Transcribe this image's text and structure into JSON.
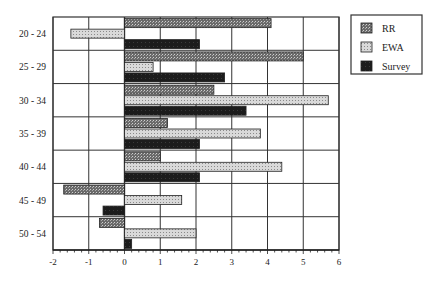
{
  "chart_data": {
    "type": "bar",
    "orientation": "horizontal",
    "title": "",
    "xlabel": "",
    "ylabel": "",
    "categories": [
      "20 - 24",
      "25 - 29",
      "30 - 34",
      "35 - 39",
      "40 - 44",
      "45 - 49",
      "50 - 54"
    ],
    "series": [
      {
        "name": "RR",
        "pattern": "dark-hatch",
        "color": "#555555",
        "values": [
          4.1,
          5.0,
          2.5,
          1.2,
          1.0,
          -1.7,
          -0.7
        ]
      },
      {
        "name": "EWA",
        "pattern": "light-dots",
        "color": "#cfcfcf",
        "values": [
          -1.5,
          0.8,
          5.7,
          3.8,
          4.4,
          1.6,
          2.0
        ]
      },
      {
        "name": "Survey",
        "pattern": "solid-dark",
        "color": "#222222",
        "values": [
          2.1,
          2.8,
          3.4,
          2.1,
          2.1,
          -0.6,
          0.2
        ]
      }
    ],
    "xlim": [
      -2,
      6
    ],
    "xticks": [
      "-2",
      "-1",
      "0",
      "1",
      "2",
      "3",
      "4",
      "5",
      "6"
    ],
    "grid": true,
    "legend_position": "upper right, outside plot"
  },
  "legend": {
    "items": [
      {
        "label": "RR"
      },
      {
        "label": "EWA"
      },
      {
        "label": "Survey"
      }
    ]
  }
}
